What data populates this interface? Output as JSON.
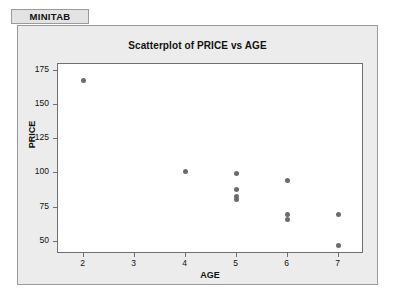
{
  "window": {
    "tab_label": "MINITAB",
    "background_color": "#ffffff",
    "panel_color": "#ececec",
    "panel_border_color": "#9a9a9a"
  },
  "chart_data": {
    "type": "scatter",
    "title": "Scatterplot of PRICE vs AGE",
    "xlabel": "AGE",
    "ylabel": "PRICE",
    "xlim": [
      1.5,
      7.5
    ],
    "ylim": [
      41,
      180
    ],
    "grid": false,
    "legend": false,
    "marker_color": "#6b6b6b",
    "plot_background": "#ffffff",
    "frame_color": "#6f6f6f",
    "xticks": [
      2,
      3,
      4,
      5,
      6,
      7
    ],
    "xtick_labels": [
      "2",
      "3",
      "4",
      "5",
      "6",
      "7"
    ],
    "yticks": [
      50,
      75,
      100,
      125,
      150,
      175
    ],
    "ytick_labels": [
      "50",
      "75",
      "100",
      "125",
      "150",
      "175"
    ],
    "points": [
      {
        "x": 2,
        "y": 168
      },
      {
        "x": 4,
        "y": 101
      },
      {
        "x": 5,
        "y": 100
      },
      {
        "x": 5,
        "y": 88
      },
      {
        "x": 5,
        "y": 83
      },
      {
        "x": 5,
        "y": 81
      },
      {
        "x": 6,
        "y": 95
      },
      {
        "x": 6,
        "y": 70
      },
      {
        "x": 6,
        "y": 66
      },
      {
        "x": 7,
        "y": 70
      },
      {
        "x": 7,
        "y": 47
      }
    ]
  }
}
